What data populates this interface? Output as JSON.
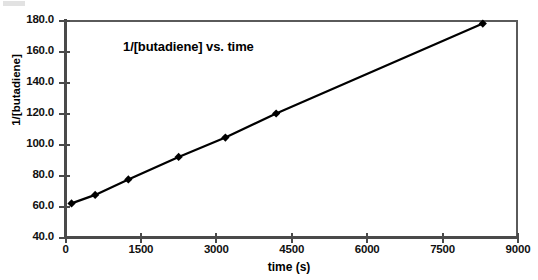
{
  "chart_data": {
    "type": "line",
    "title": "1/[butadiene] vs. time",
    "xlabel": "time (s)",
    "ylabel": "1/[butadiene]",
    "xlim": [
      0,
      9000
    ],
    "ylim": [
      40.0,
      180.0
    ],
    "xticks": [
      0,
      1500,
      3000,
      4500,
      6000,
      7500,
      9000
    ],
    "xtick_labels": [
      "0",
      "1500",
      "3000",
      "4500",
      "6000",
      "7500",
      "9000"
    ],
    "yticks": [
      40.0,
      60.0,
      80.0,
      100.0,
      120.0,
      140.0,
      160.0,
      180.0
    ],
    "ytick_labels": [
      "40.0",
      "60.0",
      "80.0",
      "100.0",
      "120.0",
      "140.0",
      "160.0",
      "180.0"
    ],
    "grid": false,
    "legend": null,
    "marker": "diamond",
    "series": [
      {
        "name": "1/[butadiene]",
        "color": "#000000",
        "x": [
          120,
          590,
          1250,
          2250,
          3180,
          4190,
          8300
        ],
        "y": [
          62.0,
          67.5,
          77.5,
          92.0,
          104.5,
          120.0,
          178.0
        ]
      }
    ]
  },
  "axes": {
    "title": "1/[butadiene] vs. time",
    "x_axis_label": "time (s)",
    "y_axis_label": "1/[butadiene]"
  }
}
